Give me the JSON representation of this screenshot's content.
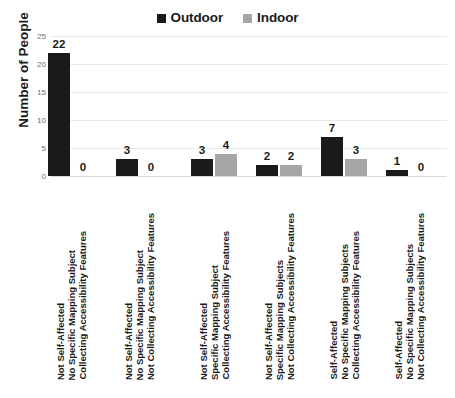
{
  "chart_data": {
    "type": "bar",
    "title": "",
    "subtitle": "",
    "xlabel": "",
    "ylabel": "Number of People",
    "ylim": [
      0,
      25
    ],
    "yticks": [
      "0",
      "5",
      "10",
      "15",
      "20",
      "25"
    ],
    "grid": true,
    "legend_position": "top-center",
    "categories": [
      "Not Self-Affected\nNo Specific Mapping Subject\nCollecting Accessibility Features",
      "Not Self-Affected\nNo Specific Mapping Subject\nNot Collecting Accessibility Features",
      "Not Self-Affected\nSpecific Mapping Subject\nCollecting Accessibility Features",
      "Not Self-Affected\nSpecific Mapping Subjects\nNot Collecting Accessibility Features",
      "Self-Affected\nNo Specific Mapping Subjects\nCollecting Accessibility Features",
      "Self-Affected\nNo Specific Mapping Subjects\nNot Collecting Accessibility Features"
    ],
    "category_lines": [
      [
        "Not Self-Affected",
        "No Specific Mapping Subject",
        "Collecting Accessibility Features"
      ],
      [
        "Not Self-Affected",
        "No Specific Mapping Subject",
        "Not Collecting Accessibility Features"
      ],
      [
        "Not Self-Affected",
        "Specific Mapping Subject",
        "Collecting Accessibility Features"
      ],
      [
        "Not Self-Affected",
        "Specific Mapping Subjects",
        "Not Collecting Accessibility Features"
      ],
      [
        "Self-Affected",
        "No Specific Mapping Subjects",
        "Collecting Accessibility Features"
      ],
      [
        "Self-Affected",
        "No Specific Mapping Subjects",
        "Not Collecting Accessibility Features"
      ]
    ],
    "series": [
      {
        "name": "Outdoor",
        "color": "#1a1a1a",
        "values": [
          22,
          3,
          3,
          2,
          7,
          1
        ]
      },
      {
        "name": "Indoor",
        "color": "#a6a6a6",
        "values": [
          0,
          0,
          4,
          2,
          3,
          0
        ]
      }
    ]
  },
  "legend": {
    "items": [
      {
        "label": "Outdoor",
        "color": "#1a1a1a",
        "marker": "square-marker"
      },
      {
        "label": "Indoor",
        "color": "#a6a6a6",
        "marker": "square-marker"
      }
    ]
  },
  "axes": {
    "y_title": "Number of People",
    "y_tick_labels": [
      "25",
      "20",
      "15",
      "10",
      "5",
      "0"
    ]
  },
  "colors": {
    "outdoor": "#1a1a1a",
    "indoor": "#a6a6a6",
    "gridline": "#e9e9e9",
    "tick_text": "#707070",
    "label_text": "#1a1a1a",
    "background": "#ffffff"
  }
}
